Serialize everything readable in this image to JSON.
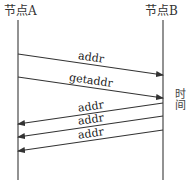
{
  "nodes": [
    {
      "id": "A",
      "label": "节点A",
      "x": 18
    },
    {
      "id": "B",
      "label": "节点B",
      "x": 163
    }
  ],
  "time_axis_label": "时间",
  "lifeline": {
    "top": 20,
    "bottom": 180,
    "color": "#777777"
  },
  "messages": [
    {
      "label": "addr",
      "from": "A",
      "to": "B",
      "y_start": 54,
      "y_end": 75
    },
    {
      "label": "getaddr",
      "from": "A",
      "to": "B",
      "y_start": 77,
      "y_end": 98
    },
    {
      "label": "addr",
      "from": "B",
      "to": "A",
      "y_start": 103,
      "y_end": 124
    },
    {
      "label": "addr",
      "from": "B",
      "to": "A",
      "y_start": 116,
      "y_end": 137
    },
    {
      "label": "addr",
      "from": "B",
      "to": "A",
      "y_start": 130,
      "y_end": 151
    }
  ],
  "colors": {
    "line": "#333333",
    "lifeline": "#777777",
    "text": "#222222"
  }
}
